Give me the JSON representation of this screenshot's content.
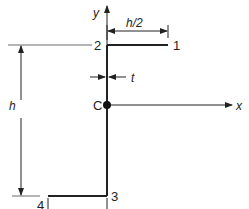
{
  "diagram": {
    "type": "Z-section cross-section",
    "points": [
      {
        "id": "1",
        "label": "1"
      },
      {
        "id": "2",
        "label": "2"
      },
      {
        "id": "3",
        "label": "3"
      },
      {
        "id": "4",
        "label": "4"
      }
    ],
    "centroid_label": "C",
    "axes": {
      "x_label": "x",
      "y_label": "y"
    },
    "dimensions": {
      "top_flange": "h/2",
      "bottom_flange": "h/2",
      "height": "h",
      "thickness": "t"
    },
    "colors": {
      "line": "#222222",
      "background": "#ffffff"
    }
  }
}
